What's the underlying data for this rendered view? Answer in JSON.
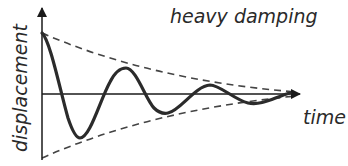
{
  "diagram": {
    "title": "heavy damping",
    "x_axis_label": "time",
    "y_axis_label": "displacement",
    "colors": {
      "curve": "#2b2b2b",
      "axes": "#1a1a1a",
      "envelope": "#444444",
      "text": "#2a2a2a"
    }
  }
}
